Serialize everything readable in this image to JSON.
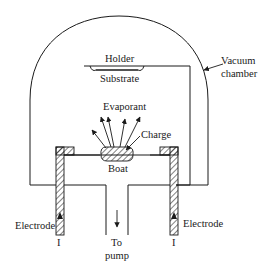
{
  "figure": {
    "labels": {
      "holder": "Holder",
      "substrate": "Substrate",
      "vacuum_line1": "Vacuum",
      "vacuum_line2": "chamber",
      "evaporant": "Evaporant",
      "charge": "Charge",
      "boat": "Boat",
      "electrode_left": "Electrode",
      "electrode_right": "Electrode",
      "current_left": "I",
      "current_right": "I",
      "pump_line1": "To",
      "pump_line2": "pump"
    },
    "colors": {
      "stroke": "#1a1a1a",
      "background": "#ffffff"
    }
  }
}
